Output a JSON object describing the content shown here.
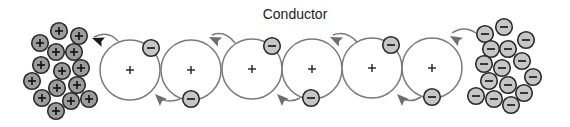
{
  "diagram": {
    "title": "Conductor",
    "colors": {
      "background": "#ffffff",
      "atom_stroke": "#7a7a7a",
      "atom_fill": "#ffffff",
      "positive_ion_fill": "#9c9c9c",
      "electron_fill": "#c6c6c6",
      "particle_stroke": "#2a2a2a",
      "arrow_gray": "#6e6e6e",
      "arrow_black": "#1a1a1a"
    },
    "positive_source": {
      "label": "positive charge cluster",
      "symbol": "+",
      "particles": [
        {
          "x": 59,
          "y": 31
        },
        {
          "x": 79,
          "y": 36
        },
        {
          "x": 40,
          "y": 43
        },
        {
          "x": 56,
          "y": 52
        },
        {
          "x": 74,
          "y": 52
        },
        {
          "x": 41,
          "y": 65
        },
        {
          "x": 62,
          "y": 71
        },
        {
          "x": 81,
          "y": 68
        },
        {
          "x": 32,
          "y": 81
        },
        {
          "x": 57,
          "y": 88
        },
        {
          "x": 77,
          "y": 85
        },
        {
          "x": 42,
          "y": 98
        },
        {
          "x": 71,
          "y": 101
        },
        {
          "x": 89,
          "y": 99
        },
        {
          "x": 56,
          "y": 111
        }
      ]
    },
    "negative_source": {
      "label": "negative charge cluster",
      "symbol": "−",
      "particles": [
        {
          "x": 504,
          "y": 27
        },
        {
          "x": 485,
          "y": 34
        },
        {
          "x": 526,
          "y": 40
        },
        {
          "x": 491,
          "y": 49
        },
        {
          "x": 508,
          "y": 49
        },
        {
          "x": 484,
          "y": 64
        },
        {
          "x": 502,
          "y": 68
        },
        {
          "x": 522,
          "y": 61
        },
        {
          "x": 533,
          "y": 77
        },
        {
          "x": 489,
          "y": 81
        },
        {
          "x": 508,
          "y": 85
        },
        {
          "x": 476,
          "y": 96
        },
        {
          "x": 494,
          "y": 99
        },
        {
          "x": 524,
          "y": 93
        },
        {
          "x": 511,
          "y": 105
        }
      ]
    },
    "atoms": [
      {
        "cx": 130,
        "cy": 70,
        "r": 30,
        "symbol": "+"
      },
      {
        "cx": 191,
        "cy": 70,
        "r": 30,
        "symbol": "+"
      },
      {
        "cx": 252,
        "cy": 69,
        "r": 30,
        "symbol": "+"
      },
      {
        "cx": 312,
        "cy": 69,
        "r": 30,
        "symbol": "+"
      },
      {
        "cx": 372,
        "cy": 68,
        "r": 30,
        "symbol": "+"
      },
      {
        "cx": 432,
        "cy": 68,
        "r": 30,
        "symbol": "+"
      }
    ],
    "electrons": [
      {
        "x": 151,
        "y": 48,
        "symbol": "−"
      },
      {
        "x": 191,
        "y": 99,
        "symbol": "−"
      },
      {
        "x": 272,
        "y": 46,
        "symbol": "−"
      },
      {
        "x": 311,
        "y": 98,
        "symbol": "−"
      },
      {
        "x": 391,
        "y": 45,
        "symbol": "−"
      },
      {
        "x": 432,
        "y": 97,
        "symbol": "−"
      }
    ],
    "arrows": [
      {
        "path": "M118 41 Q108 30 94 37",
        "head": {
          "x": 92,
          "y": 38,
          "angle": 200
        },
        "color": "black"
      },
      {
        "path": "M180 99 Q168 104 158 97",
        "head": {
          "x": 155,
          "y": 94,
          "angle": 225
        },
        "color": "gray"
      },
      {
        "path": "M235 43 Q225 30 212 35",
        "head": {
          "x": 209,
          "y": 37,
          "angle": 205
        },
        "color": "gray"
      },
      {
        "path": "M300 98 Q289 104 280 97",
        "head": {
          "x": 277,
          "y": 94,
          "angle": 225
        },
        "color": "gray"
      },
      {
        "path": "M357 42 Q346 30 333 35",
        "head": {
          "x": 330,
          "y": 37,
          "angle": 205
        },
        "color": "gray"
      },
      {
        "path": "M421 97 Q410 104 400 97",
        "head": {
          "x": 397,
          "y": 94,
          "angle": 225
        },
        "color": "gray"
      },
      {
        "path": "M476 33 Q464 25 452 33",
        "head": {
          "x": 450,
          "y": 36,
          "angle": 210
        },
        "color": "gray"
      }
    ]
  }
}
